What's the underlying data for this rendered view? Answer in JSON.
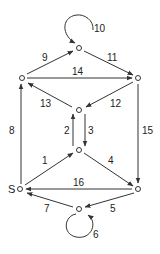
{
  "diagram": {
    "type": "directed-graph",
    "colors": {
      "line": "#333333",
      "background": "#ffffff"
    },
    "nodes": [
      {
        "id": "S",
        "label": "S",
        "x": 20,
        "y": 189
      },
      {
        "id": "A",
        "label": "",
        "x": 79,
        "y": 150
      },
      {
        "id": "B",
        "label": "",
        "x": 79,
        "y": 110
      },
      {
        "id": "C",
        "label": "",
        "x": 22,
        "y": 78
      },
      {
        "id": "D",
        "label": "",
        "x": 79,
        "y": 48
      },
      {
        "id": "E",
        "label": "",
        "x": 138,
        "y": 78
      },
      {
        "id": "F",
        "label": "",
        "x": 138,
        "y": 189
      },
      {
        "id": "G",
        "label": "",
        "x": 79,
        "y": 209
      }
    ],
    "edges": [
      {
        "label": "1",
        "from": "S",
        "to": "A"
      },
      {
        "label": "2",
        "from": "A",
        "to": "B"
      },
      {
        "label": "3",
        "from": "B",
        "to": "A"
      },
      {
        "label": "4",
        "from": "A",
        "to": "F"
      },
      {
        "label": "5",
        "from": "F",
        "to": "G"
      },
      {
        "label": "6",
        "from": "G",
        "to": "G"
      },
      {
        "label": "7",
        "from": "G",
        "to": "S"
      },
      {
        "label": "8",
        "from": "S",
        "to": "C"
      },
      {
        "label": "9",
        "from": "C",
        "to": "D"
      },
      {
        "label": "10",
        "from": "D",
        "to": "D"
      },
      {
        "label": "11",
        "from": "D",
        "to": "E"
      },
      {
        "label": "12",
        "from": "E",
        "to": "B"
      },
      {
        "label": "13",
        "from": "B",
        "to": "C"
      },
      {
        "label": "14",
        "from": "C",
        "to": "E"
      },
      {
        "label": "15",
        "from": "E",
        "to": "F"
      },
      {
        "label": "16",
        "from": "F",
        "to": "S"
      }
    ]
  }
}
